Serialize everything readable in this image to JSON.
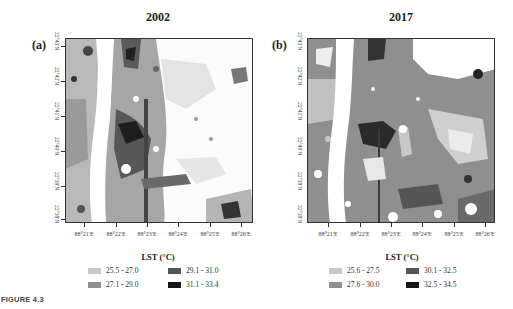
{
  "figure_label": "FIGURE 4.3",
  "panels": [
    {
      "label": "(a)",
      "year": "2002",
      "y_ticks": [
        "22°43'N",
        "22°42'N",
        "22°41'N",
        "22°40'N",
        "22°39'N",
        "22°38'N"
      ],
      "x_ticks": [
        "88°21'E",
        "88°22'E",
        "88°23'E",
        "88°24'E",
        "88°25'E",
        "88°26'E"
      ],
      "legend_title": "LST (°C)",
      "legend": [
        {
          "range": "25.5 - 27.0",
          "color": "#c8c8c8"
        },
        {
          "range": "27.1 - 29.0",
          "color": "#8f8f8f"
        },
        {
          "range": "29.1 - 31.0",
          "color": "#555555"
        },
        {
          "range": "31.1 - 33.4",
          "color": "#151515"
        }
      ]
    },
    {
      "label": "(b)",
      "year": "2017",
      "y_ticks": [
        "22°43'N",
        "22°42'N",
        "22°41'N",
        "22°40'N",
        "22°39'N",
        "22°38'N"
      ],
      "x_ticks": [
        "88°21'E",
        "88°22'E",
        "88°23'E",
        "88°24'E",
        "88°25'E",
        "88°26'E"
      ],
      "legend_title": "LST (°C)",
      "legend": [
        {
          "range": "25.6 - 27.5",
          "color": "#c8c8c8"
        },
        {
          "range": "27.6 - 30.0",
          "color": "#8f8f8f"
        },
        {
          "range": "30.1 - 32.5",
          "color": "#555555"
        },
        {
          "range": "32.5 - 34.5",
          "color": "#151515"
        }
      ]
    }
  ]
}
